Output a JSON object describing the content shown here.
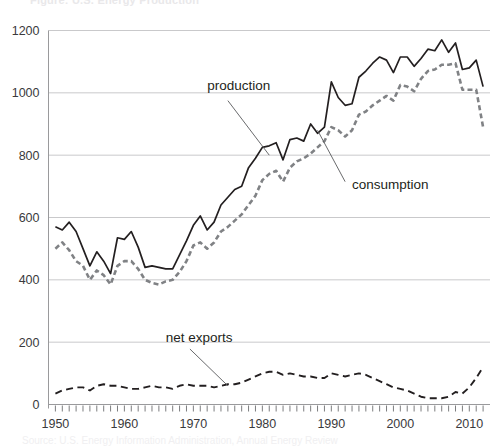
{
  "figure": {
    "cut_off_title": "Figure: U.S. Energy Production",
    "cut_off_caption": "Source: U.S. Energy Information Administration, Annual Energy Review"
  },
  "axes": {
    "y_ticks": [
      0,
      200,
      400,
      600,
      800,
      1000,
      1200
    ],
    "y_tick_labels": [
      "0",
      "200",
      "400",
      "600",
      "800",
      "1000",
      "1200"
    ],
    "x_ticks": [
      1950,
      1960,
      1970,
      1980,
      1990,
      2000,
      2010
    ],
    "x_tick_labels": [
      "1950",
      "1960",
      "1970",
      "1980",
      "1990",
      "2000",
      "2010"
    ],
    "minor_tick_interval": 1,
    "grid": "horizontal"
  },
  "labels": {
    "production": "production",
    "consumption": "consumption",
    "net_exports": "net exports"
  },
  "colors": {
    "production_line": "#231f20",
    "consumption_line": "#808285",
    "net_exports_line": "#231f20",
    "gridline": "#c9c9cb",
    "axis": "#9a9a9c",
    "tick_text": "#3a3a3c",
    "background": "#ffffff"
  },
  "chart_data": {
    "type": "line",
    "title": "",
    "subtitle": "",
    "xlabel": "",
    "ylabel": "",
    "xlim": [
      1949,
      2013
    ],
    "ylim": [
      0,
      1200
    ],
    "grid": true,
    "legend_position": "inline-annotations",
    "annotations": [
      {
        "text": "production",
        "x": 1972,
        "y": 1010,
        "points_to_x": 1981,
        "points_to_y": 800
      },
      {
        "text": "consumption",
        "x": 1993,
        "y": 690,
        "points_to_x": 1988,
        "points_to_y": 880
      },
      {
        "text": "net exports",
        "x": 1966,
        "y": 200,
        "points_to_x": 1975,
        "points_to_y": 60
      }
    ],
    "x": [
      1950,
      1951,
      1952,
      1953,
      1954,
      1955,
      1956,
      1957,
      1958,
      1959,
      1960,
      1961,
      1962,
      1963,
      1964,
      1965,
      1966,
      1967,
      1968,
      1969,
      1970,
      1971,
      1972,
      1973,
      1974,
      1975,
      1976,
      1977,
      1978,
      1979,
      1980,
      1981,
      1982,
      1983,
      1984,
      1985,
      1986,
      1987,
      1988,
      1989,
      1990,
      1991,
      1992,
      1993,
      1994,
      1995,
      1996,
      1997,
      1998,
      1999,
      2000,
      2001,
      2002,
      2003,
      2004,
      2005,
      2006,
      2007,
      2008,
      2009,
      2010,
      2011,
      2012
    ],
    "series": [
      {
        "name": "production",
        "style": "solid",
        "color": "#231f20",
        "values": [
          570,
          560,
          585,
          555,
          500,
          445,
          490,
          460,
          420,
          535,
          530,
          555,
          505,
          440,
          445,
          440,
          435,
          435,
          480,
          525,
          575,
          605,
          560,
          585,
          640,
          665,
          690,
          700,
          760,
          790,
          825,
          830,
          840,
          785,
          850,
          855,
          845,
          900,
          870,
          890,
          1035,
          985,
          960,
          965,
          1050,
          1070,
          1095,
          1115,
          1105,
          1065,
          1115,
          1115,
          1085,
          1110,
          1140,
          1135,
          1170,
          1130,
          1160,
          1075,
          1080,
          1105,
          1020
        ]
      },
      {
        "name": "consumption",
        "style": "dashed",
        "color": "#808285",
        "values": [
          500,
          520,
          495,
          460,
          445,
          400,
          430,
          415,
          385,
          445,
          460,
          460,
          435,
          400,
          390,
          385,
          395,
          400,
          425,
          460,
          510,
          520,
          500,
          520,
          555,
          570,
          590,
          610,
          640,
          670,
          720,
          740,
          750,
          715,
          760,
          780,
          790,
          805,
          825,
          845,
          890,
          880,
          860,
          880,
          930,
          940,
          960,
          975,
          990,
          975,
          1025,
          1020,
          1005,
          1045,
          1070,
          1075,
          1090,
          1090,
          1095,
          1010,
          1010,
          1010,
          890
        ]
      },
      {
        "name": "net exports",
        "style": "dashed",
        "color": "#231f20",
        "values": [
          35,
          45,
          50,
          55,
          55,
          45,
          60,
          65,
          60,
          60,
          55,
          50,
          50,
          55,
          60,
          55,
          55,
          50,
          60,
          65,
          60,
          60,
          60,
          55,
          60,
          65,
          65,
          70,
          80,
          90,
          100,
          105,
          105,
          95,
          100,
          95,
          90,
          90,
          85,
          85,
          100,
          95,
          90,
          95,
          100,
          95,
          85,
          75,
          65,
          55,
          50,
          45,
          35,
          25,
          20,
          20,
          20,
          25,
          40,
          35,
          55,
          85,
          120
        ]
      }
    ]
  }
}
